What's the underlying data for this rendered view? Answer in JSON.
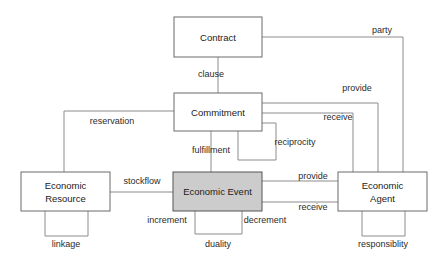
{
  "diagram": {
    "canvas": {
      "width": 442,
      "height": 261,
      "background": "#ffffff"
    },
    "colors": {
      "entity_fill": "#ffffff",
      "entity_fill_highlight": "#cccccc",
      "entity_stroke": "#6b6b6b",
      "line_stroke": "#8c8c8c",
      "text": "#1a1a1a"
    },
    "entities": [
      {
        "id": "contract",
        "label": "Contract",
        "x": 174,
        "y": 17,
        "w": 88,
        "h": 40,
        "highlighted": false,
        "lines": [
          "Contract"
        ]
      },
      {
        "id": "commitment",
        "label": "Commitment",
        "x": 174,
        "y": 93,
        "w": 88,
        "h": 38,
        "highlighted": false,
        "lines": [
          "Commitment"
        ]
      },
      {
        "id": "economic-event",
        "label": "Economic Event",
        "x": 173,
        "y": 172,
        "w": 89,
        "h": 39,
        "highlighted": true,
        "lines": [
          "Economic Event"
        ]
      },
      {
        "id": "economic-resource",
        "label": "Economic Resource",
        "x": 21,
        "y": 172,
        "w": 89,
        "h": 39,
        "highlighted": false,
        "lines": [
          "Economic",
          "Resource"
        ]
      },
      {
        "id": "economic-agent",
        "label": "Economic Agent",
        "x": 338,
        "y": 172,
        "w": 89,
        "h": 39,
        "highlighted": false,
        "lines": [
          "Economic",
          "Agent"
        ]
      }
    ],
    "relationships": [
      {
        "id": "clause",
        "label": "clause",
        "from": "contract",
        "to": "commitment",
        "label_x": 211,
        "label_y": 75
      },
      {
        "id": "party",
        "label": "party",
        "from": "contract",
        "to": "economic-agent",
        "label_x": 382,
        "label_y": 31
      },
      {
        "id": "reservation",
        "label": "reservation",
        "from": "commitment",
        "to": "economic-resource",
        "label_x": 112,
        "label_y": 122
      },
      {
        "id": "fulfillment",
        "label": "fulfillment",
        "from": "commitment",
        "to": "economic-event",
        "label_x": 211,
        "label_y": 151
      },
      {
        "id": "reciprocity",
        "label": "reciprocity",
        "from": "commitment",
        "to": "commitment",
        "label_x": 295,
        "label_y": 143
      },
      {
        "id": "provide-commit",
        "label": "provide",
        "from": "commitment",
        "to": "economic-agent",
        "label_x": 357,
        "label_y": 89
      },
      {
        "id": "receive-commit",
        "label": "receive",
        "from": "commitment",
        "to": "economic-agent",
        "label_x": 338,
        "label_y": 118
      },
      {
        "id": "stockflow",
        "label": "stockflow",
        "from": "economic-resource",
        "to": "economic-event",
        "label_x": 142,
        "label_y": 182
      },
      {
        "id": "provide-event",
        "label": "provide",
        "from": "economic-event",
        "to": "economic-agent",
        "label_x": 313,
        "label_y": 177
      },
      {
        "id": "receive-event",
        "label": "receive",
        "from": "economic-event",
        "to": "economic-agent",
        "label_x": 313,
        "label_y": 208
      },
      {
        "id": "linkage",
        "label": "linkage",
        "from": "economic-resource",
        "to": "economic-resource",
        "label_x": 66,
        "label_y": 245
      },
      {
        "id": "duality",
        "label": "duality",
        "from": "economic-event",
        "to": "economic-event",
        "label_x": 218,
        "label_y": 245
      },
      {
        "id": "increment",
        "label": "increment",
        "from": "economic-event",
        "to": "economic-event",
        "label_x": 167,
        "label_y": 221
      },
      {
        "id": "decrement",
        "label": "decrement",
        "from": "economic-event",
        "to": "economic-event",
        "label_x": 265,
        "label_y": 221
      },
      {
        "id": "responsiblity",
        "label": "responsiblity",
        "from": "economic-agent",
        "to": "economic-agent",
        "label_x": 383,
        "label_y": 245
      }
    ]
  }
}
